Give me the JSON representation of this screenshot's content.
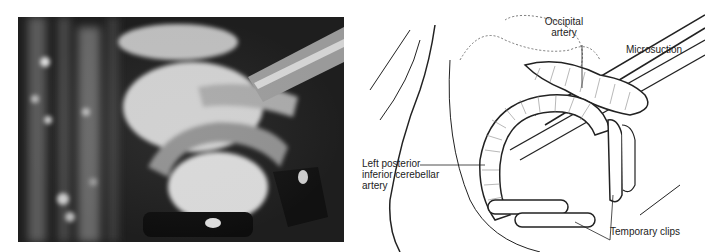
{
  "figure": {
    "photo": {
      "description": "Intraoperative microscope photograph",
      "tone": "grayscale"
    },
    "illustration": {
      "labels": {
        "occipital_artery_line1": "Occipital",
        "occipital_artery_line2": "artery",
        "microsuction": "Microsuction",
        "pica_line1": "Left posterior",
        "pica_line2": "inferior cerebellar",
        "pica_line3": "artery",
        "temporary_clips": "Temporary clips"
      }
    }
  }
}
